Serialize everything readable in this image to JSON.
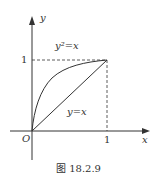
{
  "figure": {
    "caption": "图 18.2.9",
    "axes": {
      "x_label": "x",
      "y_label": "y",
      "origin_label": "O",
      "x_tick": "1",
      "y_tick": "1"
    },
    "curves": [
      {
        "name": "parabola",
        "label": "y²=x",
        "equation": "y^2 = x"
      },
      {
        "name": "line",
        "label": "y=x",
        "equation": "y = x"
      }
    ]
  }
}
